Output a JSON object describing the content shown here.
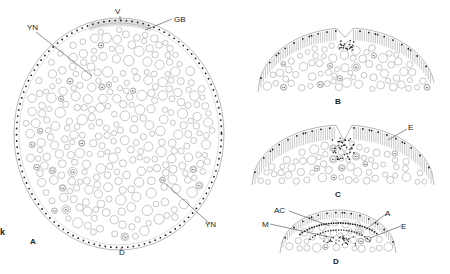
{
  "figure": {
    "panels": [
      {
        "id": "A",
        "label": "A",
        "description": "Full cross-section of yolk-filled egg/blastoderm"
      },
      {
        "id": "B",
        "label": "B",
        "description": "Section showing initial invagination"
      },
      {
        "id": "C",
        "label": "C",
        "description": "Section showing deepened invagination"
      },
      {
        "id": "D",
        "label": "D",
        "description": "Section showing layered germ band"
      }
    ],
    "annotations": {
      "A": {
        "V": "V",
        "GB": "GB",
        "YN_top": "YN",
        "YN_bottom": "YN",
        "D": "D",
        "side_mark": "k"
      },
      "C": {
        "E": "E"
      },
      "D": {
        "AC": "AC",
        "M": "M",
        "A": "A",
        "E": "E"
      }
    },
    "colors": {
      "cell_outline": "#9a9a9a",
      "nucleus_dot": "#1e1e1e",
      "leader_line": "#444444",
      "text": "#222222",
      "background": "#ffffff"
    }
  }
}
